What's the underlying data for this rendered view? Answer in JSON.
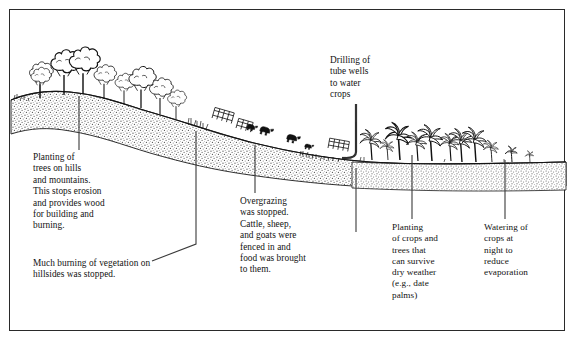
{
  "figure": {
    "kind": "line-drawing-diagram",
    "frame_color": "#2a2a2a",
    "background_color": "#ffffff",
    "ink_color": "#111111"
  },
  "labels": [
    {
      "id": "planting-trees",
      "text": "Planting of\ntrees on hills\nand mountains.\nThis stops erosion\nand provides wood\nfor building and\nburning.",
      "x": 33,
      "y": 152
    },
    {
      "id": "much-burning",
      "text": "Much burning of vegetation on\nhillsides was stopped.",
      "x": 33,
      "y": 258
    },
    {
      "id": "overgrazing",
      "text": "Overgrazing\nwas stopped.\nCattle, sheep,\nand goats were\nfenced in and\nfood was brought\nto them.",
      "x": 240,
      "y": 196
    },
    {
      "id": "tube-wells",
      "text": "Drilling of\ntube wells\nto water\ncrops",
      "x": 330,
      "y": 55
    },
    {
      "id": "planting-crops",
      "text": "Planting\nof crops and\ntrees that\ncan survive\ndry weather\n(e.g., date\npalms)",
      "x": 392,
      "y": 222
    },
    {
      "id": "watering-crops",
      "text": "Watering of\ncrops at\nnight to\nreduce\nevaporation",
      "x": 484,
      "y": 222
    }
  ],
  "scene": {
    "ground_description": "Stippled soil band sloping down from upper-left hill to a flat plain at right",
    "elements": [
      {
        "name": "broadleaf-trees-on-hill",
        "count": 9,
        "region": "left hill crest"
      },
      {
        "name": "grass-tufts",
        "count": 12,
        "region": "mid slope"
      },
      {
        "name": "fence-sections",
        "count": 3,
        "region": "mid slope"
      },
      {
        "name": "grazing-animals",
        "count": 4,
        "region": "mid slope"
      },
      {
        "name": "tube-well",
        "count": 1,
        "region": "center-right plain"
      },
      {
        "name": "palm-trees",
        "count": 11,
        "region": "right plain"
      }
    ]
  },
  "leaders": [
    {
      "id": "leader-planting-trees",
      "from": [
        79,
        97
      ],
      "to": [
        79,
        148
      ]
    },
    {
      "id": "leader-much-burning",
      "from": [
        196,
        133
      ],
      "to": [
        196,
        243
      ],
      "bend_to": [
        152,
        258
      ]
    },
    {
      "id": "leader-overgrazing",
      "from": [
        255,
        146
      ],
      "to": [
        255,
        192
      ]
    },
    {
      "id": "leader-tube-wells",
      "from": [
        356,
        104
      ],
      "to": [
        356,
        228
      ]
    },
    {
      "id": "leader-planting-crops",
      "from": [
        412,
        155
      ],
      "to": [
        412,
        218
      ]
    },
    {
      "id": "leader-watering-crops",
      "from": [
        505,
        162
      ],
      "to": [
        505,
        218
      ]
    }
  ]
}
